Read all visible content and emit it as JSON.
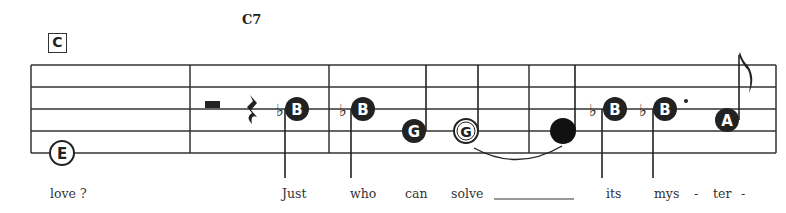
{
  "rehearsal_mark": "C",
  "chord_symbol": "C7",
  "staff": {
    "lines_y": [
      65,
      87,
      109,
      131,
      153
    ],
    "left_x": 31,
    "right_x": 776,
    "barlines_x": [
      190,
      329,
      529
    ]
  },
  "notes": [
    {
      "name": "E",
      "style": "hollow",
      "x": 62,
      "y": 153,
      "stem": "none"
    },
    {
      "name": "rest-half",
      "style": "rest",
      "x": 212,
      "y": 104
    },
    {
      "name": "rest-quarter",
      "style": "rest",
      "x": 253,
      "y": 110
    },
    {
      "name": "B",
      "accidental": "♭",
      "style": "filled",
      "x": 296,
      "y": 109,
      "stem": "down"
    },
    {
      "name": "B",
      "accidental": "♭",
      "style": "filled",
      "x": 363,
      "y": 109,
      "stem": "down"
    },
    {
      "name": "G",
      "style": "filled",
      "x": 413,
      "y": 131,
      "stem": "up"
    },
    {
      "name": "G",
      "style": "hollow",
      "x": 465,
      "y": 131,
      "stem": "up"
    },
    {
      "name": "",
      "style": "filled-plain",
      "x": 563,
      "y": 131,
      "stem": "up"
    },
    {
      "name": "B",
      "accidental": "♭",
      "style": "filled",
      "x": 615,
      "y": 109,
      "stem": "down"
    },
    {
      "name": "B",
      "accidental": "♭",
      "style": "filled",
      "x": 665,
      "y": 109,
      "stem": "down",
      "dotted": true
    },
    {
      "name": "A",
      "style": "filled",
      "x": 726,
      "y": 120,
      "stem": "up-flag"
    }
  ],
  "lyrics": [
    {
      "text": "love ?",
      "x": 50
    },
    {
      "text": "Just",
      "x": 282
    },
    {
      "text": "who",
      "x": 350
    },
    {
      "text": "can",
      "x": 405
    },
    {
      "text": "solve",
      "x": 451
    },
    {
      "text": "its",
      "x": 606
    },
    {
      "text": "mys",
      "x": 654
    },
    {
      "text": "-",
      "x": 694
    },
    {
      "text": "ter",
      "x": 713
    },
    {
      "text": "-",
      "x": 741
    }
  ],
  "tie_label": "tie",
  "extender_label": "melisma-extender"
}
